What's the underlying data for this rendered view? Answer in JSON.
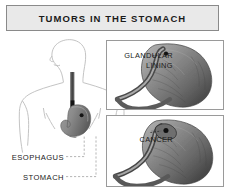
{
  "banner": {
    "title": "TUMORS IN THE STOMACH"
  },
  "anatomy": {
    "labels": [
      {
        "name": "esophagus",
        "text": "ESOPHAGUS"
      },
      {
        "name": "stomach",
        "text": "STOMACH"
      }
    ]
  },
  "panels": [
    {
      "name": "glandular-lining",
      "label": "GLANDULAR\nLINING"
    },
    {
      "name": "cancer",
      "label": "CANCER"
    }
  ],
  "colors": {
    "banner_fill": "#e9e9e9",
    "banner_border": "#8a8a8a",
    "panel_border": "#9a9a9a",
    "body_outline": "#b9b9b9",
    "organ_dark": "#4a4a4a",
    "organ_mid": "#8d8d8d",
    "organ_light": "#c8c8c8",
    "lesion": "#171717",
    "text": "#1b1b1b",
    "leader_line": "#9a9a9a",
    "background": "#ffffff"
  }
}
